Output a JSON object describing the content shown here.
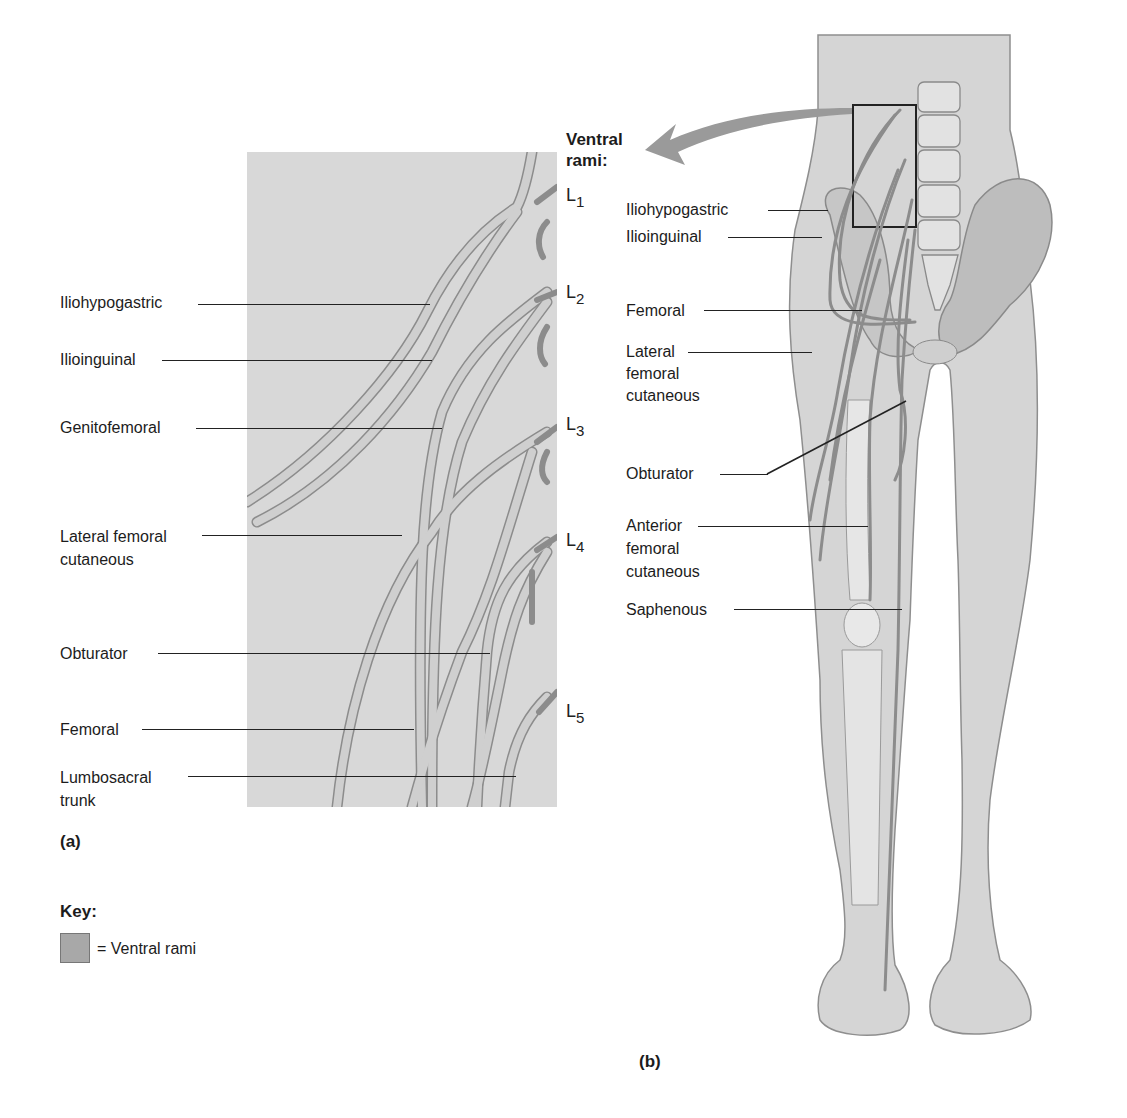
{
  "figure": {
    "panel_a": {
      "caption": "(a)",
      "labels": [
        {
          "id": "iliohypogastric",
          "text": "Iliohypogastric"
        },
        {
          "id": "ilioinguinal",
          "text": "Ilioinguinal"
        },
        {
          "id": "genitofemoral",
          "text": "Genitofemoral"
        },
        {
          "id": "lateral_femoral_cutaneous",
          "line1": "Lateral femoral",
          "line2": "cutaneous"
        },
        {
          "id": "obturator",
          "text": "Obturator"
        },
        {
          "id": "femoral",
          "text": "Femoral"
        },
        {
          "id": "lumbosacral_trunk",
          "line1": "Lumbosacral",
          "line2": "trunk"
        }
      ],
      "spinal_levels": [
        {
          "base": "L",
          "sub": "1"
        },
        {
          "base": "L",
          "sub": "2"
        },
        {
          "base": "L",
          "sub": "3"
        },
        {
          "base": "L",
          "sub": "4"
        },
        {
          "base": "L",
          "sub": "5"
        }
      ]
    },
    "panel_b": {
      "caption": "(b)",
      "heading_line1": "Ventral",
      "heading_line2": "rami:",
      "labels": [
        {
          "id": "iliohypogastric",
          "text": "Iliohypogastric"
        },
        {
          "id": "ilioinguinal",
          "text": "Ilioinguinal"
        },
        {
          "id": "femoral",
          "text": "Femoral"
        },
        {
          "id": "lateral_femoral_cutaneous",
          "line1": "Lateral",
          "line2": "femoral",
          "line3": "cutaneous"
        },
        {
          "id": "obturator",
          "text": "Obturator"
        },
        {
          "id": "anterior_femoral_cutaneous",
          "line1": "Anterior",
          "line2": "femoral",
          "line3": "cutaneous"
        },
        {
          "id": "saphenous",
          "text": "Saphenous"
        }
      ]
    },
    "key": {
      "title": "Key:",
      "items": [
        {
          "swatch_color": "#a8a8a8",
          "label": "= Ventral rami"
        }
      ]
    },
    "colors": {
      "panel_bg": "#d8d8d8",
      "nerve_fill": "#c4c4c4",
      "nerve_edge": "#8a8a8a",
      "skin": "#d4d4d4",
      "bone": "#e6e6e6",
      "arrow": "#9a9a9a"
    }
  }
}
